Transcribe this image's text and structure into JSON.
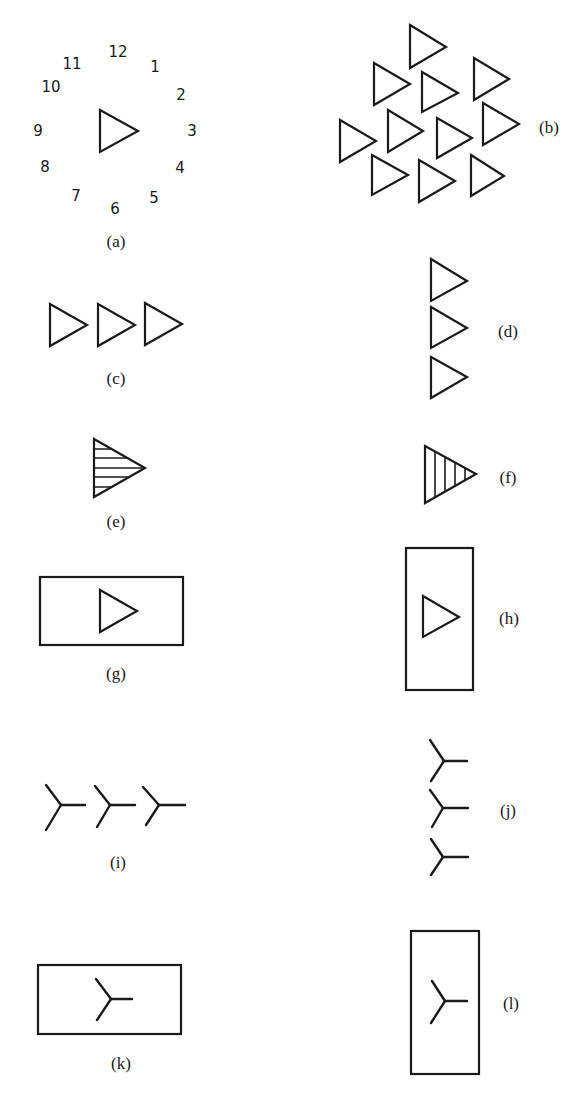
{
  "figure": {
    "stroke_color": "#1a1a1a",
    "background": "#ffffff",
    "panels": {
      "a": {
        "label": "(a)",
        "label_pos": [
          116,
          241
        ],
        "description": "Single triangle pointing at 3 o'clock surrounded by clock-face numerals",
        "clock_numbers": [
          {
            "text": "12",
            "x": 118,
            "y": 52
          },
          {
            "text": "1",
            "x": 155,
            "y": 67
          },
          {
            "text": "2",
            "x": 181,
            "y": 95
          },
          {
            "text": "3",
            "x": 192,
            "y": 131
          },
          {
            "text": "4",
            "x": 180,
            "y": 168
          },
          {
            "text": "5",
            "x": 154,
            "y": 198
          },
          {
            "text": "6",
            "x": 115,
            "y": 209
          },
          {
            "text": "7",
            "x": 76,
            "y": 196
          },
          {
            "text": "8",
            "x": 45,
            "y": 167
          },
          {
            "text": "9",
            "x": 38,
            "y": 131
          },
          {
            "text": "10",
            "x": 51,
            "y": 87
          },
          {
            "text": "11",
            "x": 72,
            "y": 64
          }
        ],
        "triangles": [
          [
            100,
            110,
            152,
            138,
            131
          ]
        ]
      },
      "b": {
        "label": "(b)",
        "label_pos": [
          549,
          127
        ],
        "description": "Cluster of eleven triangles all pointing right",
        "triangles": [
          [
            410,
            25,
            68,
            446,
            47
          ],
          [
            374,
            63,
            105,
            410,
            84
          ],
          [
            422,
            72,
            112,
            458,
            93
          ],
          [
            474,
            58,
            100,
            509,
            79
          ],
          [
            340,
            120,
            162,
            376,
            141
          ],
          [
            388,
            110,
            152,
            423,
            131
          ],
          [
            437,
            118,
            158,
            472,
            138
          ],
          [
            483,
            103,
            145,
            519,
            124
          ],
          [
            372,
            155,
            195,
            408,
            175
          ],
          [
            419,
            160,
            202,
            455,
            181
          ],
          [
            471,
            155,
            196,
            504,
            176
          ]
        ]
      },
      "c": {
        "label": "(c)",
        "label_pos": [
          116,
          378
        ],
        "description": "Three triangles in a horizontal row",
        "triangles": [
          [
            50,
            304,
            346,
            87,
            325
          ],
          [
            98,
            304,
            346,
            135,
            325
          ],
          [
            145,
            303,
            345,
            182,
            324
          ]
        ]
      },
      "d": {
        "label": "(d)",
        "label_pos": [
          508,
          331
        ],
        "description": "Three triangles in a vertical column",
        "triangles": [
          [
            431,
            259,
            301,
            467,
            281
          ],
          [
            431,
            307,
            348,
            467,
            328
          ],
          [
            431,
            357,
            398,
            467,
            377
          ]
        ]
      },
      "e": {
        "label": "(e)",
        "label_pos": [
          116,
          521
        ],
        "description": "Triangle with horizontal stripes",
        "triangle": [
          94,
          439,
          497,
          145,
          468
        ],
        "hatch": "horizontal",
        "hatch_lines": [
          449,
          458,
          468,
          477,
          487
        ]
      },
      "f": {
        "label": "(f)",
        "label_pos": [
          508,
          477
        ],
        "description": "Triangle with vertical stripes",
        "triangle": [
          425,
          446,
          503,
          476,
          474
        ],
        "hatch": "vertical",
        "hatch_lines": [
          435,
          445,
          455,
          465
        ]
      },
      "g": {
        "label": "(g)",
        "label_pos": [
          116,
          673
        ],
        "description": "Triangle inside a horizontal rectangular frame",
        "frame": [
          40,
          577,
          143,
          68
        ],
        "triangle": [
          100,
          590,
          632,
          137,
          611
        ]
      },
      "h": {
        "label": "(h)",
        "label_pos": [
          509,
          618
        ],
        "description": "Triangle inside a vertical rectangular frame",
        "frame": [
          406,
          548,
          67,
          142
        ],
        "triangle": [
          423,
          596,
          637,
          459,
          617
        ]
      },
      "i": {
        "label": "(i)",
        "label_pos": [
          118,
          862
        ],
        "description": "Three Y-shaped figures in a horizontal row",
        "ys": [
          {
            "c": [
              61,
              805
            ],
            "ul": [
              46,
              785
            ],
            "dl": [
              46,
              830
            ],
            "r": [
              85,
              805
            ]
          },
          {
            "c": [
              110,
              805
            ],
            "ul": [
              95,
              786
            ],
            "dl": [
              97,
              827
            ],
            "r": [
              135,
              805
            ]
          },
          {
            "c": [
              159,
              805
            ],
            "ul": [
              143,
              787
            ],
            "dl": [
              146,
              825
            ],
            "r": [
              185,
              805
            ]
          }
        ]
      },
      "j": {
        "label": "(j)",
        "label_pos": [
          508,
          810
        ],
        "description": "Three Y-shaped figures in a vertical column",
        "ys": [
          {
            "c": [
              444,
              761
            ],
            "ul": [
              430,
              740
            ],
            "dl": [
              431,
              781
            ],
            "r": [
              467,
              761
            ]
          },
          {
            "c": [
              443,
              808
            ],
            "ul": [
              430,
              790
            ],
            "dl": [
              432,
              827
            ],
            "r": [
              468,
              808
            ]
          },
          {
            "c": [
              443,
              857
            ],
            "ul": [
              431,
              839
            ],
            "dl": [
              431,
              875
            ],
            "r": [
              468,
              857
            ]
          }
        ]
      },
      "k": {
        "label": "(k)",
        "label_pos": [
          121,
          1063
        ],
        "description": "Y-shaped figure inside a horizontal rectangular frame",
        "frame": [
          38,
          965,
          143,
          69
        ],
        "ys": [
          {
            "c": [
              111,
              999
            ],
            "ul": [
              96,
              979
            ],
            "dl": [
              97,
              1020
            ],
            "r": [
              132,
              999
            ]
          }
        ]
      },
      "l": {
        "label": "(l)",
        "label_pos": [
          511,
          1003
        ],
        "description": "Y-shaped figure inside a vertical rectangular frame",
        "frame": [
          411,
          931,
          68,
          143
        ],
        "ys": [
          {
            "c": [
              445,
              1001
            ],
            "ul": [
              432,
              981
            ],
            "dl": [
              431,
              1023
            ],
            "r": [
              467,
              1001
            ]
          }
        ]
      }
    }
  }
}
